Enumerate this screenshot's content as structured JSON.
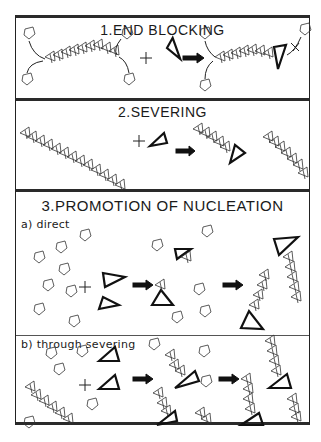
{
  "figure": {
    "panels": [
      {
        "id": "end-blocking",
        "title": "1.END BLOCKING"
      },
      {
        "id": "severing",
        "title": "2.SEVERING"
      },
      {
        "id": "promotion-of-nucleation",
        "title": "3.PROMOTION OF NUCLEATION",
        "subpanels": [
          {
            "id": "direct",
            "label": "a) direct"
          },
          {
            "id": "through-severing",
            "label": "b) through severing"
          }
        ]
      }
    ],
    "symbols": {
      "plus": "+",
      "block_mark": "X"
    },
    "colors": {
      "line": "#222222",
      "background": "#ffffff"
    }
  }
}
